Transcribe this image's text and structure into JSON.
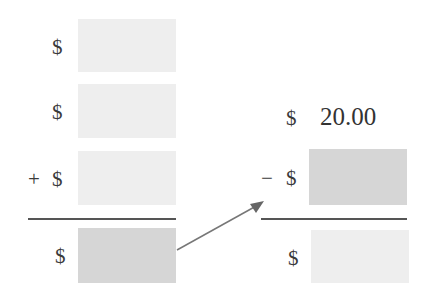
{
  "left_column": {
    "rows": [
      {
        "operator": "",
        "currency": "$",
        "value": "",
        "shade": "light"
      },
      {
        "operator": "",
        "currency": "$",
        "value": "",
        "shade": "light"
      },
      {
        "operator": "+",
        "currency": "$",
        "value": "",
        "shade": "light"
      }
    ],
    "result": {
      "currency": "$",
      "value": "",
      "shade": "dark"
    }
  },
  "right_column": {
    "top": {
      "currency": "$",
      "value": "20.00"
    },
    "subtract": {
      "operator": "−",
      "currency": "$",
      "value": "",
      "shade": "dark"
    },
    "result": {
      "currency": "$",
      "value": "",
      "shade": "light"
    }
  },
  "colors": {
    "light_box": "#eeeeee",
    "dark_box": "#d6d6d6",
    "line": "#555555",
    "arrow": "#777777"
  }
}
